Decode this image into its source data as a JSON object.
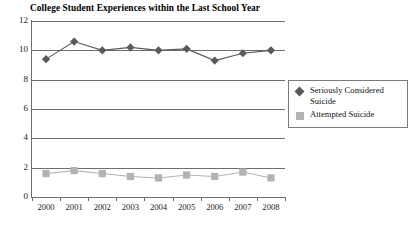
{
  "chart_data": {
    "type": "line",
    "title": "College Student Experiences within the Last School Year",
    "xlabel": "",
    "ylabel": "",
    "categories": [
      "2000",
      "2001",
      "2002",
      "2003",
      "2004",
      "2005",
      "2006",
      "2007",
      "2008"
    ],
    "series": [
      {
        "name": "Seriously Considered Suicide",
        "marker": "diamond",
        "color": "#5a5a5a",
        "values": [
          9.4,
          10.6,
          10.0,
          10.2,
          10.0,
          10.1,
          9.3,
          9.8,
          10.0
        ]
      },
      {
        "name": "Attempted Suicide",
        "marker": "square",
        "color": "#b3b3b3",
        "values": [
          1.6,
          1.8,
          1.6,
          1.4,
          1.3,
          1.5,
          1.4,
          1.7,
          1.3
        ]
      }
    ],
    "ylim": [
      0,
      12
    ],
    "yticks": [
      "0",
      "2",
      "4",
      "6",
      "8",
      "10",
      "12"
    ],
    "grid": true,
    "legend_position": "right"
  },
  "legend": {
    "entries": [
      {
        "label": "Seriously Considered Suicide",
        "marker": "diamond-marker-icon"
      },
      {
        "label": "Attempted Suicide",
        "marker": "square-marker-icon"
      }
    ]
  },
  "colors": {
    "series_1": "#5a5a5a",
    "series_2": "#b3b3b3",
    "axis": "#6e6e6e",
    "text": "#1a1a1a",
    "background": "#ffffff"
  }
}
